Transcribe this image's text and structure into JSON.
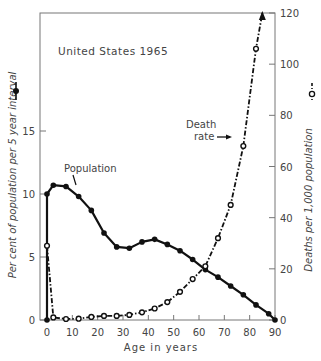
{
  "chart_data": {
    "type": "line",
    "title": "United States 1965",
    "xlabel": "Age in years",
    "ylabel_left": "Per cent of population per 5 year interval",
    "ylabel_right": "Deaths per 1,000 population",
    "xlim": [
      0,
      90
    ],
    "ylim_left": [
      0,
      20
    ],
    "ylim_right": [
      0,
      120
    ],
    "x_ticks": [
      0,
      10,
      20,
      30,
      40,
      50,
      60,
      70,
      80,
      90
    ],
    "y_ticks_left": [
      0,
      5,
      10,
      15
    ],
    "y_ticks_right": [
      0,
      20,
      40,
      60,
      80,
      100,
      120
    ],
    "grid": false,
    "annotations": [
      {
        "text": "Population",
        "points_to": "population series near age 12"
      },
      {
        "text": "Death rate",
        "points_to": "death rate series near age 75"
      }
    ],
    "series": [
      {
        "name": "Population",
        "axis": "left",
        "style": "solid line, filled circle markers",
        "x": [
          0,
          0,
          2.5,
          7.5,
          12.5,
          17.5,
          22.5,
          27.5,
          32.5,
          37.5,
          42.5,
          47.5,
          52.5,
          57.5,
          62.5,
          67.5,
          72.5,
          77.5,
          82.5,
          87.5,
          90
        ],
        "values": [
          0,
          10.0,
          10.7,
          10.6,
          9.8,
          8.7,
          6.9,
          5.8,
          5.7,
          6.2,
          6.4,
          6.0,
          5.5,
          4.8,
          4.0,
          3.4,
          2.7,
          2.0,
          1.2,
          0.5,
          0
        ]
      },
      {
        "name": "Death rate",
        "axis": "right",
        "style": "dash-dot line, open circle markers, arrow at end",
        "x": [
          0,
          2.5,
          7.5,
          12.5,
          17.5,
          22.5,
          27.5,
          32.5,
          37.5,
          42.5,
          47.5,
          52.5,
          57.5,
          62.5,
          67.5,
          72.5,
          77.5,
          82.5,
          85
        ],
        "values": [
          29,
          1.0,
          0.4,
          0.5,
          1.2,
          1.6,
          1.6,
          2.0,
          3.0,
          4.5,
          7.0,
          11,
          16,
          21,
          32,
          45,
          68,
          106,
          120
        ]
      }
    ]
  },
  "labels": {
    "title": "United States 1965",
    "xlabel": "Age in years",
    "ylabel_left": "Per cent of population per 5 year interval",
    "ylabel_right": "Deaths per 1,000 population",
    "population_annotation": "Population",
    "death_annotation_1": "Death",
    "death_annotation_2": "rate"
  }
}
